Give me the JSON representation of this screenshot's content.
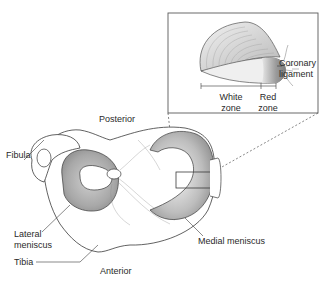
{
  "diagram": {
    "labels": {
      "fibula": "Fibula",
      "posterior": "Posterior",
      "lateral_meniscus_1": "Lateral",
      "lateral_meniscus_2": "meniscus",
      "tibia": "Tibia",
      "anterior": "Anterior",
      "medial_meniscus": "Medial meniscus"
    },
    "inset": {
      "coronary_1": "Coronary",
      "coronary_2": "ligament",
      "white_zone_1": "White",
      "white_zone_2": "zone",
      "red_zone_1": "Red",
      "red_zone_2": "zone"
    },
    "colors": {
      "line": "#3a3a3a",
      "meniscus_shade": "#9a9a9a",
      "light_shade": "#d8d8d8",
      "background": "#ffffff"
    }
  }
}
